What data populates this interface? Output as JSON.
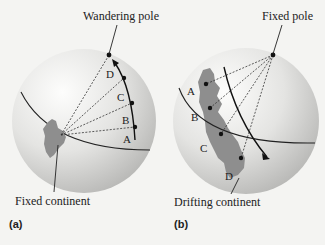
{
  "colors": {
    "background": "#f4f4f2",
    "sphere_light": "#fbfbfa",
    "sphere_dark": "#bdbdbb",
    "continent": "#8e8e8e",
    "line": "#222222"
  },
  "panels": [
    {
      "id": "a",
      "panel_label": "(a)",
      "pole_label": "Wandering pole",
      "continent_label": "Fixed continent",
      "points": [
        "A",
        "B",
        "C",
        "D"
      ]
    },
    {
      "id": "b",
      "panel_label": "(b)",
      "pole_label": "Fixed pole",
      "continent_label": "Drifting continent",
      "points": [
        "A",
        "B",
        "C",
        "D"
      ]
    }
  ]
}
